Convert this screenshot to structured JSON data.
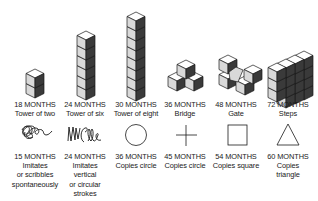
{
  "block_row": [
    {
      "age": "18 MONTHS",
      "desc": "Tower of two",
      "icon": "tower-of-two-blocks"
    },
    {
      "age": "24 MONTHS",
      "desc": "Tower of six",
      "icon": "tower-of-six-blocks"
    },
    {
      "age": "30 MONTHS",
      "desc": "Tower of eight",
      "icon": "tower-of-eight-blocks"
    },
    {
      "age": "36 MONTHS",
      "desc": "Bridge",
      "icon": "bridge-blocks"
    },
    {
      "age": "48 MONTHS",
      "desc": "Gate",
      "icon": "gate-blocks"
    },
    {
      "age": "72 MONTHS",
      "desc": "Steps",
      "icon": "steps-blocks"
    }
  ],
  "drawing_row": [
    {
      "age": "15 MONTHS",
      "desc": [
        "Imitates",
        "or scribbles",
        "spontaneously"
      ],
      "icon": "scribble"
    },
    {
      "age": "24 MONTHS",
      "desc": [
        "Imitates",
        "vertical",
        "or circular",
        "strokes"
      ],
      "icon": "vertical-circular-strokes"
    },
    {
      "age": "36 MONTHS",
      "desc": [
        "Copies circle"
      ],
      "icon": "circle"
    },
    {
      "age": "45 MONTHS",
      "desc": [
        "Copies circle"
      ],
      "icon": "cross"
    },
    {
      "age": "54 MONTHS",
      "desc": [
        "Copies square"
      ],
      "icon": "square"
    },
    {
      "age": "60 MONTHS",
      "desc": [
        "Copies",
        "triangle"
      ],
      "icon": "triangle"
    }
  ],
  "colors": {
    "top": "#ffffff",
    "left": "#d9d9d9",
    "right": "#3a3a3a",
    "stroke": "#1a1a1a"
  }
}
